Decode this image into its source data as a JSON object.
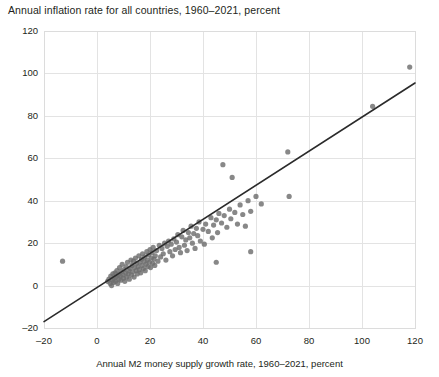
{
  "chart_data": {
    "type": "scatter",
    "title": "Annual inflation rate for all countries, 1960–2021, percent",
    "xlabel": "Annual M2 money supply growth rate, 1960–2021, percent",
    "ylabel": "",
    "xlim": [
      -20,
      120
    ],
    "ylim": [
      -20,
      120
    ],
    "xticks": [
      -20,
      0,
      20,
      40,
      60,
      80,
      100,
      120
    ],
    "yticks": [
      -20,
      0,
      20,
      40,
      60,
      80,
      100,
      120
    ],
    "xtick_labels": [
      "–20",
      "0",
      "20",
      "40",
      "60",
      "80",
      "100",
      "120"
    ],
    "ytick_labels": [
      "–20",
      "0",
      "20",
      "40",
      "60",
      "80",
      "100",
      "120"
    ],
    "grid": true,
    "legend": null,
    "point_color": "#6e6e6e",
    "trendline_color": "#2b2b2b",
    "grid_color": "#e3e3e3",
    "trendline": {
      "type": "linear",
      "x_start": -20,
      "y_start": -17,
      "x_end": 120,
      "y_end": 95.5
    },
    "points": [
      [
        -13.0,
        11.5
      ],
      [
        4.0,
        2.0
      ],
      [
        4.5,
        3.0
      ],
      [
        5.0,
        1.0
      ],
      [
        5.2,
        4.5
      ],
      [
        5.5,
        0.0
      ],
      [
        5.8,
        2.5
      ],
      [
        6.0,
        5.5
      ],
      [
        6.2,
        1.5
      ],
      [
        6.5,
        3.5
      ],
      [
        6.8,
        6.0
      ],
      [
        7.0,
        2.0
      ],
      [
        7.2,
        4.0
      ],
      [
        7.5,
        7.0
      ],
      [
        7.8,
        1.0
      ],
      [
        8.0,
        5.0
      ],
      [
        8.2,
        3.0
      ],
      [
        8.5,
        8.5
      ],
      [
        8.8,
        4.5
      ],
      [
        9.0,
        2.5
      ],
      [
        9.2,
        6.5
      ],
      [
        9.5,
        10.0
      ],
      [
        9.8,
        5.0
      ],
      [
        10.0,
        3.5
      ],
      [
        10.2,
        7.5
      ],
      [
        10.5,
        2.0
      ],
      [
        10.8,
        6.0
      ],
      [
        11.0,
        9.0
      ],
      [
        11.2,
        4.0
      ],
      [
        11.5,
        11.0
      ],
      [
        11.8,
        5.5
      ],
      [
        12.0,
        7.0
      ],
      [
        12.2,
        3.0
      ],
      [
        12.5,
        8.0
      ],
      [
        12.8,
        12.0
      ],
      [
        13.0,
        5.0
      ],
      [
        13.2,
        9.5
      ],
      [
        13.5,
        6.5
      ],
      [
        13.8,
        11.5
      ],
      [
        14.0,
        4.0
      ],
      [
        14.2,
        8.5
      ],
      [
        14.5,
        13.0
      ],
      [
        14.8,
        7.0
      ],
      [
        15.0,
        10.5
      ],
      [
        15.2,
        5.5
      ],
      [
        15.5,
        9.0
      ],
      [
        15.8,
        14.0
      ],
      [
        16.0,
        7.5
      ],
      [
        16.2,
        11.0
      ],
      [
        16.5,
        6.0
      ],
      [
        16.8,
        12.5
      ],
      [
        17.0,
        9.5
      ],
      [
        17.2,
        15.0
      ],
      [
        17.5,
        8.0
      ],
      [
        17.8,
        11.5
      ],
      [
        18.0,
        13.5
      ],
      [
        18.2,
        7.0
      ],
      [
        18.5,
        10.0
      ],
      [
        18.8,
        16.0
      ],
      [
        19.0,
        12.0
      ],
      [
        19.2,
        9.0
      ],
      [
        19.5,
        14.5
      ],
      [
        19.8,
        11.0
      ],
      [
        20.0,
        17.0
      ],
      [
        20.2,
        8.5
      ],
      [
        20.5,
        13.0
      ],
      [
        20.8,
        15.5
      ],
      [
        21.0,
        10.5
      ],
      [
        21.2,
        18.0
      ],
      [
        21.5,
        12.5
      ],
      [
        21.8,
        9.5
      ],
      [
        22.0,
        14.0
      ],
      [
        22.5,
        16.5
      ],
      [
        23.0,
        11.5
      ],
      [
        23.5,
        19.0
      ],
      [
        24.0,
        13.5
      ],
      [
        24.5,
        17.5
      ],
      [
        25.0,
        15.0
      ],
      [
        25.5,
        20.0
      ],
      [
        26.0,
        12.0
      ],
      [
        26.5,
        18.5
      ],
      [
        27.0,
        21.0
      ],
      [
        27.5,
        16.0
      ],
      [
        28.0,
        19.5
      ],
      [
        28.5,
        14.0
      ],
      [
        29.0,
        22.0
      ],
      [
        29.5,
        17.0
      ],
      [
        30.0,
        20.5
      ],
      [
        30.5,
        24.0
      ],
      [
        31.0,
        18.0
      ],
      [
        31.5,
        15.5
      ],
      [
        32.0,
        23.0
      ],
      [
        32.5,
        26.0
      ],
      [
        33.0,
        19.0
      ],
      [
        33.5,
        21.5
      ],
      [
        34.0,
        16.5
      ],
      [
        34.5,
        25.0
      ],
      [
        35.0,
        22.5
      ],
      [
        35.5,
        28.0
      ],
      [
        36.0,
        20.0
      ],
      [
        36.5,
        24.5
      ],
      [
        37.0,
        17.5
      ],
      [
        37.5,
        27.0
      ],
      [
        38.0,
        23.5
      ],
      [
        38.5,
        30.0
      ],
      [
        39.0,
        21.0
      ],
      [
        40.0,
        26.5
      ],
      [
        40.5,
        19.5
      ],
      [
        41.0,
        29.0
      ],
      [
        42.0,
        25.5
      ],
      [
        43.0,
        32.0
      ],
      [
        43.5,
        22.5
      ],
      [
        44.0,
        28.5
      ],
      [
        45.0,
        31.0
      ],
      [
        45.5,
        25.0
      ],
      [
        46.0,
        34.0
      ],
      [
        47.0,
        29.5
      ],
      [
        47.5,
        57.0
      ],
      [
        48.0,
        33.0
      ],
      [
        49.0,
        27.5
      ],
      [
        50.0,
        36.0
      ],
      [
        50.5,
        31.5
      ],
      [
        51.0,
        51.0
      ],
      [
        52.0,
        34.5
      ],
      [
        53.0,
        29.0
      ],
      [
        54.0,
        38.0
      ],
      [
        55.0,
        33.5
      ],
      [
        56.0,
        28.0
      ],
      [
        57.0,
        40.0
      ],
      [
        58.0,
        35.0
      ],
      [
        60.0,
        42.0
      ],
      [
        62.0,
        38.5
      ],
      [
        45.0,
        11.0
      ],
      [
        58.0,
        16.0
      ],
      [
        72.0,
        63.0
      ],
      [
        72.5,
        42.0
      ],
      [
        104.0,
        84.5
      ],
      [
        118.0,
        103.0
      ]
    ]
  }
}
